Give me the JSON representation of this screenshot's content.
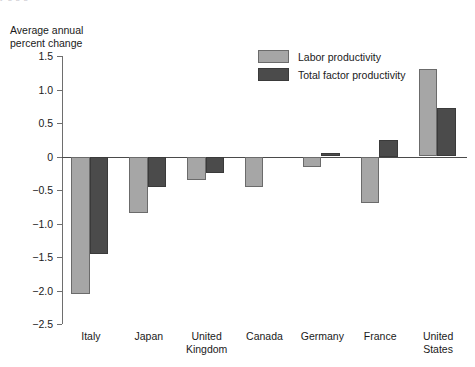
{
  "top_fragment": "y g                          g                                        g",
  "axis_title": "Average annual\npercent change",
  "legend": {
    "items": [
      {
        "label": "Labor productivity",
        "key": "labor",
        "color": "#a6a6a6"
      },
      {
        "label": "Total factor productivity",
        "key": "tfp",
        "color": "#4b4b4b"
      }
    ]
  },
  "chart_data": {
    "type": "bar",
    "title": "",
    "subtitle": "",
    "xlabel": "",
    "ylabel": "Average annual percent change",
    "ylim": [
      -2.5,
      1.5
    ],
    "ytick_values": [
      1.5,
      1.0,
      0.5,
      0,
      -0.5,
      -1.0,
      -1.5,
      -2.0,
      -2.5
    ],
    "ytick_labels": [
      "1.5",
      "1.0",
      "0.5",
      "0",
      "−0.5",
      "−1.0",
      "−1.5",
      "−2.0",
      "−2.5"
    ],
    "grid": false,
    "legend_position": "upper-center-right",
    "zero_line": 0,
    "categories": [
      "Italy",
      "Japan",
      "United\nKingdom",
      "Canada",
      "Germany",
      "France",
      "United\nStates"
    ],
    "series": [
      {
        "name": "Labor productivity",
        "color": "#a6a6a6",
        "values": [
          -2.05,
          -0.85,
          -0.35,
          -0.45,
          -0.15,
          -0.7,
          1.3
        ]
      },
      {
        "name": "Total factor productivity",
        "color": "#4b4b4b",
        "values": [
          -1.45,
          -0.45,
          -0.25,
          0.0,
          0.05,
          0.25,
          0.72
        ]
      }
    ]
  }
}
